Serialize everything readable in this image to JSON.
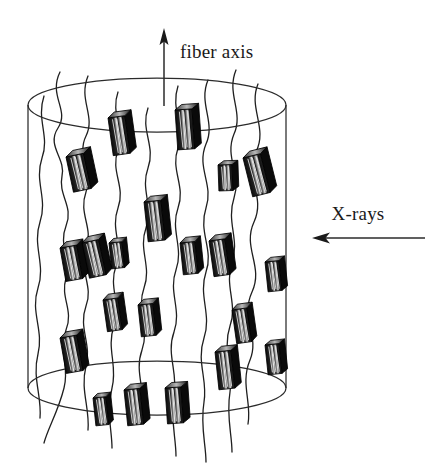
{
  "figure": {
    "kind": "polymer-fiber-microstructure-diagram",
    "background_color": "#ffffff",
    "line_color": "#2b2b2b",
    "crystallite_fill": "#111111",
    "crystallite_highlight": "#f2f2f2",
    "labels": {
      "fiber_axis": "fiber axis",
      "x_rays": "X-rays"
    },
    "annotations": {
      "fiber_axis_arrow": {
        "direction": "up",
        "x": 164,
        "y_tip": 30,
        "y_tail": 106
      },
      "x_rays_arrow": {
        "direction": "left",
        "y": 238,
        "x_tip": 314,
        "x_tail": 425
      },
      "fiber_axis_label_pos": {
        "x": 180,
        "y": 58
      },
      "x_rays_label_pos": {
        "x": 358,
        "y": 220
      }
    },
    "cylinder": {
      "center_x": 157,
      "left_x": 28,
      "right_x": 287,
      "top_ellipse_cy": 105,
      "bottom_ellipse_cy": 388,
      "rx": 129,
      "ry": 27
    },
    "crystallites": [
      {
        "x": 108,
        "y": 118,
        "w": 17,
        "h": 38,
        "rot": -8
      },
      {
        "x": 175,
        "y": 110,
        "w": 17,
        "h": 40,
        "rot": -4
      },
      {
        "x": 66,
        "y": 157,
        "w": 18,
        "h": 36,
        "rot": -12
      },
      {
        "x": 243,
        "y": 158,
        "w": 18,
        "h": 40,
        "rot": -14
      },
      {
        "x": 218,
        "y": 165,
        "w": 14,
        "h": 26,
        "rot": -2
      },
      {
        "x": 144,
        "y": 202,
        "w": 17,
        "h": 40,
        "rot": -6
      },
      {
        "x": 60,
        "y": 248,
        "w": 17,
        "h": 34,
        "rot": -10
      },
      {
        "x": 82,
        "y": 243,
        "w": 17,
        "h": 36,
        "rot": -12
      },
      {
        "x": 109,
        "y": 243,
        "w": 13,
        "h": 26,
        "rot": -6
      },
      {
        "x": 180,
        "y": 243,
        "w": 15,
        "h": 32,
        "rot": -6
      },
      {
        "x": 209,
        "y": 241,
        "w": 16,
        "h": 36,
        "rot": -8
      },
      {
        "x": 265,
        "y": 262,
        "w": 14,
        "h": 30,
        "rot": -6
      },
      {
        "x": 103,
        "y": 300,
        "w": 15,
        "h": 32,
        "rot": -8
      },
      {
        "x": 138,
        "y": 305,
        "w": 15,
        "h": 32,
        "rot": -6
      },
      {
        "x": 232,
        "y": 310,
        "w": 15,
        "h": 34,
        "rot": -8
      },
      {
        "x": 60,
        "y": 338,
        "w": 17,
        "h": 36,
        "rot": -10
      },
      {
        "x": 265,
        "y": 345,
        "w": 14,
        "h": 30,
        "rot": -6
      },
      {
        "x": 215,
        "y": 352,
        "w": 16,
        "h": 38,
        "rot": -6
      },
      {
        "x": 93,
        "y": 398,
        "w": 13,
        "h": 28,
        "rot": -6
      },
      {
        "x": 124,
        "y": 390,
        "w": 16,
        "h": 36,
        "rot": -6
      },
      {
        "x": 165,
        "y": 388,
        "w": 16,
        "h": 36,
        "rot": -4
      }
    ],
    "chains": [
      "M 60 72 C 48 96, 70 110, 58 128 C 46 146, 66 158, 62 176 C 58 196, 74 206, 66 226 C 58 246, 72 258, 66 278 C 60 298, 74 310, 66 330 C 58 352, 70 366, 64 388 C 58 412, 48 428, 44 443",
      "M 88 76 C 78 100, 96 116, 86 136 C 76 156, 94 172, 86 192 C 78 214, 94 228, 86 248 C 78 270, 94 286, 86 306 C 78 328, 92 344, 86 366 C 80 390, 90 408, 88 430",
      "M 118 92 C 110 114, 126 130, 118 150 C 110 172, 126 186, 118 208 C 110 230, 124 246, 116 266 C 108 288, 122 304, 114 326 C 106 348, 118 366, 112 388 C 106 412, 112 430, 112 448",
      "M 148 108 C 140 130, 156 146, 148 168 C 140 190, 154 206, 146 228 C 138 250, 152 266, 144 288 C 136 310, 150 328, 142 350 C 134 372, 146 390, 142 412",
      "M 178 86 C 170 110, 186 126, 178 148 C 170 170, 186 186, 178 208 C 170 230, 184 248, 176 270 C 168 292, 182 310, 174 332 C 166 354, 178 372, 174 394 C 170 418, 176 438, 176 456",
      "M 208 80 C 198 104, 216 122, 206 144 C 196 168, 214 184, 206 208 C 198 232, 214 250, 206 272 C 198 296, 212 314, 204 338 C 196 362, 208 380, 204 402 C 200 426, 206 444, 206 462",
      "M 236 70 C 226 94, 244 112, 234 134 C 224 158, 242 174, 234 198 C 226 222, 240 240, 232 262 C 224 286, 238 304, 230 326 C 222 350, 234 368, 230 392 C 226 416, 232 434, 232 452",
      "M 258 84 C 248 108, 268 128, 256 152 C 244 178, 266 196, 254 222 C 242 248, 264 266, 252 292 C 240 318, 260 336, 250 360 C 240 384, 252 402, 248 424",
      "M 44 96 C 36 120, 50 136, 42 158 C 34 182, 48 198, 40 222 C 32 246, 46 264, 38 288 C 30 312, 44 330, 38 354 C 32 378, 42 396, 40 418"
    ]
  }
}
